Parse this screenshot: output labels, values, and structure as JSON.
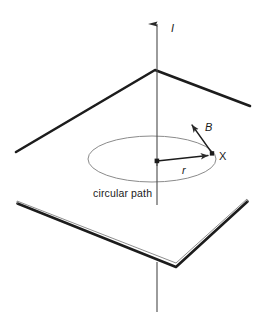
{
  "figure": {
    "background_color": "#ffffff",
    "width": 266,
    "height": 334
  },
  "labels": {
    "current": "I",
    "magnetic_field": "B",
    "field_point": "X",
    "radius": "r",
    "caption": "circular path"
  },
  "colors": {
    "ink": "#1c1c1c",
    "plane_edge": "#1c1c1c",
    "plane_edge_light": "#7a7a7a",
    "path_stroke": "#8b8b8b",
    "axis": "#4a4a4a"
  },
  "geometry": {
    "wire_axis": {
      "x": 157,
      "top_y": 18,
      "bottom_y": 312,
      "arrow_tip_y": 18
    },
    "upper_plane": {
      "apex": [
        155,
        70
      ],
      "left_end": [
        16,
        152
      ],
      "right_end": [
        250,
        106
      ]
    },
    "lower_plane": {
      "vertex": [
        176,
        267
      ],
      "left_end": [
        17,
        203
      ],
      "right_end": [
        247,
        201
      ]
    },
    "circular_path": {
      "center": [
        152,
        159
      ],
      "rx": 64,
      "ry": 23
    },
    "radius_vector": {
      "from": [
        157,
        161
      ],
      "to": [
        213,
        155
      ]
    },
    "field_vector": {
      "from": [
        212,
        153
      ],
      "to": [
        189,
        121
      ]
    }
  }
}
